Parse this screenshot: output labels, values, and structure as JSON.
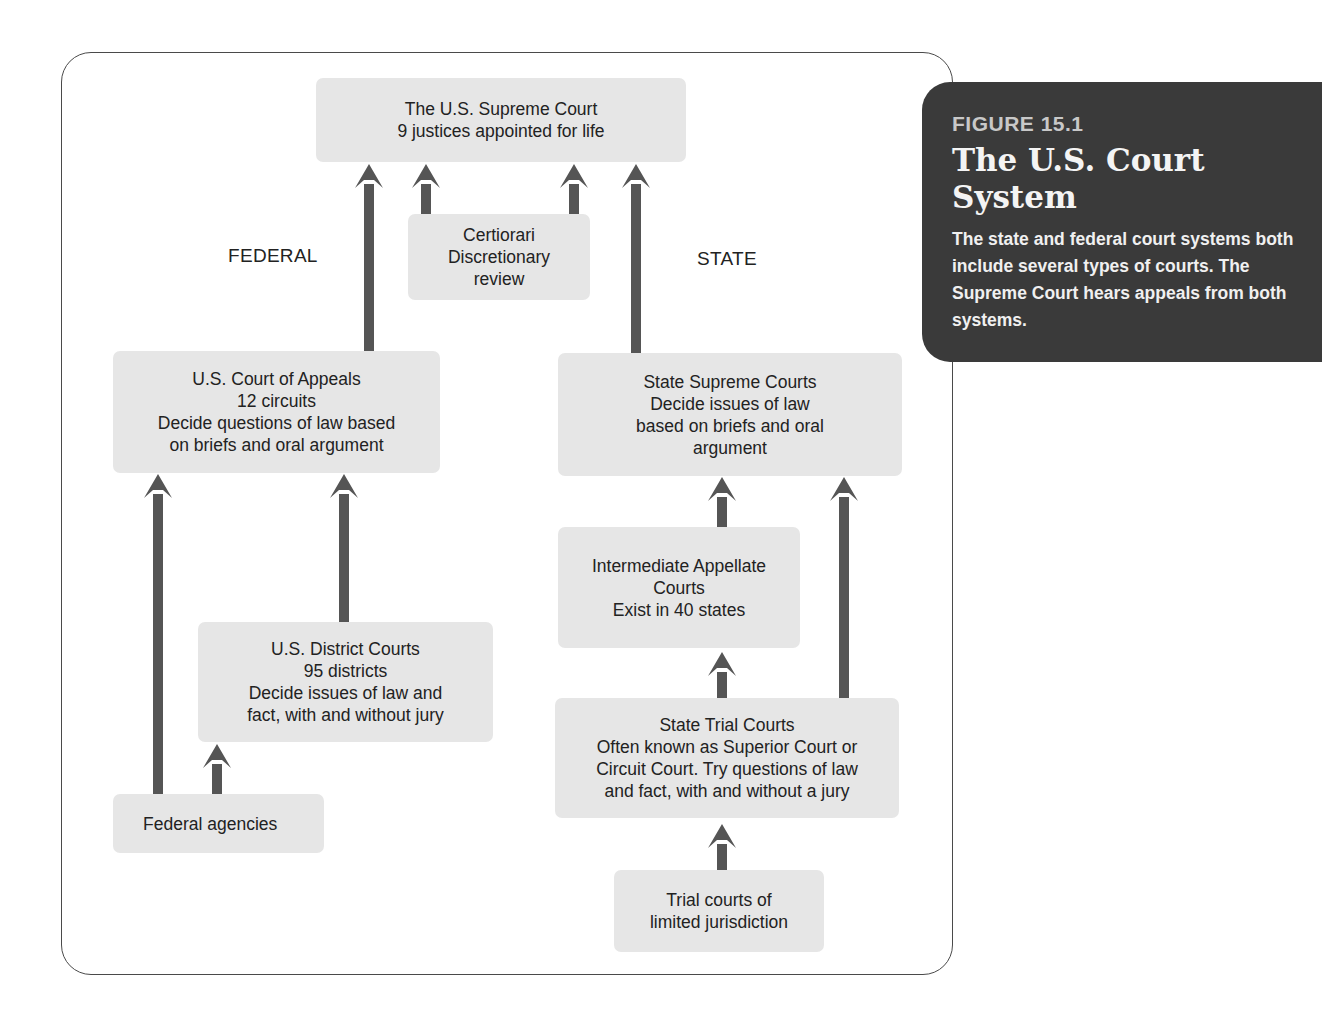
{
  "caption": {
    "figure_label": "FIGURE 15.1",
    "title": "The U.S. Court System",
    "description": "The state and federal court systems both include several types of courts. The Supreme Court hears appeals from both systems."
  },
  "labels": {
    "federal": "FEDERAL",
    "state": "STATE"
  },
  "nodes": {
    "supreme_court": "The U.S. Supreme Court\n9 justices appointed for life",
    "certiorari": "Certiorari\nDiscretionary\nreview",
    "court_of_appeals": "U.S. Court of Appeals\n12 circuits\nDecide questions of law based\non briefs and oral argument",
    "district_courts": "U.S. District Courts\n95 districts\nDecide issues of law and\nfact, with and without jury",
    "federal_agencies": "Federal agencies",
    "state_supreme_courts": "State Supreme Courts\nDecide issues of law\nbased on briefs and oral\nargument",
    "intermediate_appellate": "Intermediate Appellate\nCourts\nExist in 40 states",
    "state_trial_courts": "State Trial Courts\nOften known as Superior Court or\nCircuit Court. Try questions of law\nand fact, with and without a jury",
    "limited_jurisdiction": "Trial courts of\nlimited jurisdiction"
  },
  "edges": [
    {
      "from": "court_of_appeals",
      "to": "supreme_court"
    },
    {
      "from": "certiorari",
      "to": "supreme_court",
      "side": "left"
    },
    {
      "from": "certiorari",
      "to": "supreme_court",
      "side": "right"
    },
    {
      "from": "state_supreme_courts",
      "to": "supreme_court"
    },
    {
      "from": "federal_agencies",
      "to": "court_of_appeals"
    },
    {
      "from": "district_courts",
      "to": "court_of_appeals"
    },
    {
      "from": "federal_agencies",
      "to": "district_courts"
    },
    {
      "from": "intermediate_appellate",
      "to": "state_supreme_courts"
    },
    {
      "from": "state_trial_courts",
      "to": "state_supreme_courts"
    },
    {
      "from": "state_trial_courts",
      "to": "intermediate_appellate"
    },
    {
      "from": "limited_jurisdiction",
      "to": "state_trial_courts"
    }
  ],
  "colors": {
    "box_fill": "#e6e6e6",
    "arrow": "#555555",
    "caption_bg": "#3a3a3a",
    "frame_border": "#4a4a4a"
  }
}
